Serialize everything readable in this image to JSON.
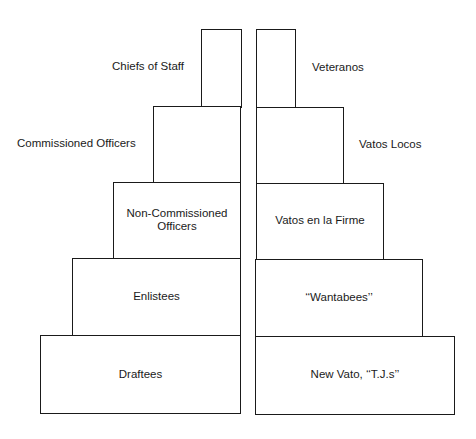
{
  "diagram": {
    "type": "stepped-pyramid-comparison",
    "left_pyramid": {
      "levels": [
        {
          "label": "Chiefs of Staff",
          "label_position": "outside-left"
        },
        {
          "label": "Commissioned Officers",
          "label_position": "outside-left"
        },
        {
          "label": "Non-Commissioned Officers",
          "line1": "Non-Commissioned",
          "line2": "Officers",
          "label_position": "inside"
        },
        {
          "label": "Enlistees",
          "label_position": "inside"
        },
        {
          "label": "Draftees",
          "label_position": "inside"
        }
      ]
    },
    "right_pyramid": {
      "levels": [
        {
          "label": "Veteranos",
          "label_position": "outside-right"
        },
        {
          "label": "Vatos Locos",
          "label_position": "outside-right"
        },
        {
          "label": "Vatos en la Firme",
          "label_position": "inside"
        },
        {
          "label": "‘‘Wantabees’’",
          "label_position": "inside"
        },
        {
          "label": "New Vato, ‘‘T.J.s’’",
          "label_position": "inside"
        }
      ]
    }
  }
}
